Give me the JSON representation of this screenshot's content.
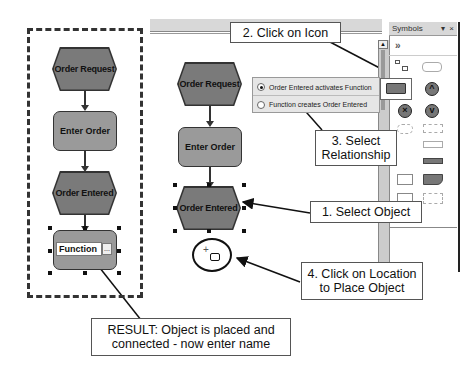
{
  "left_diagram": {
    "nodes": [
      {
        "type": "event",
        "label": "Order Request"
      },
      {
        "type": "function",
        "label": "Enter Order"
      },
      {
        "type": "event",
        "label": "Order Entered"
      },
      {
        "type": "function",
        "label": "Function",
        "editing": true,
        "edit_button": "..."
      }
    ]
  },
  "right_diagram": {
    "nodes": [
      {
        "type": "event",
        "label": "Order Request"
      },
      {
        "type": "function",
        "label": "Enter Order"
      },
      {
        "type": "event",
        "label": "Order Entered",
        "selected": true
      }
    ],
    "placement_cursor": "+"
  },
  "relationship_popup": {
    "options": [
      {
        "label": "Order Entered activates Function",
        "selected": true
      },
      {
        "label": "Function creates Order Entered",
        "selected": false
      }
    ]
  },
  "symbols_panel": {
    "title": "Symbols",
    "pin": "▾",
    "close": "×",
    "toolbar_glyph": "»"
  },
  "callouts": {
    "step1": "1. Select Object",
    "step2": "2. Click on Icon",
    "step3_line1": "3. Select",
    "step3_line2": "Relationship",
    "step4_line1": "4. Click on Location",
    "step4_line2": "to Place Object",
    "result_line1": "RESULT: Object is placed and",
    "result_line2": "connected - now enter name"
  },
  "colors": {
    "event_fill": "#7a7a7a",
    "function_fill": "#9a9a9a",
    "outline": "#333333",
    "popup_bg": "#e6e6e6"
  }
}
